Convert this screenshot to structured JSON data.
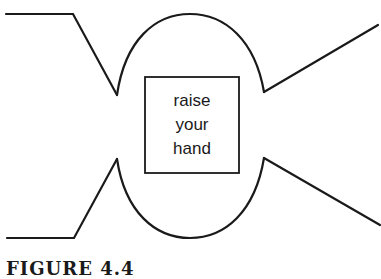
{
  "diagram": {
    "box_text_lines": [
      "raise",
      "your",
      "hand"
    ],
    "caption": "FIGURE 4.4"
  },
  "colors": {
    "stroke": "#1a1a1a",
    "background": "#ffffff"
  }
}
